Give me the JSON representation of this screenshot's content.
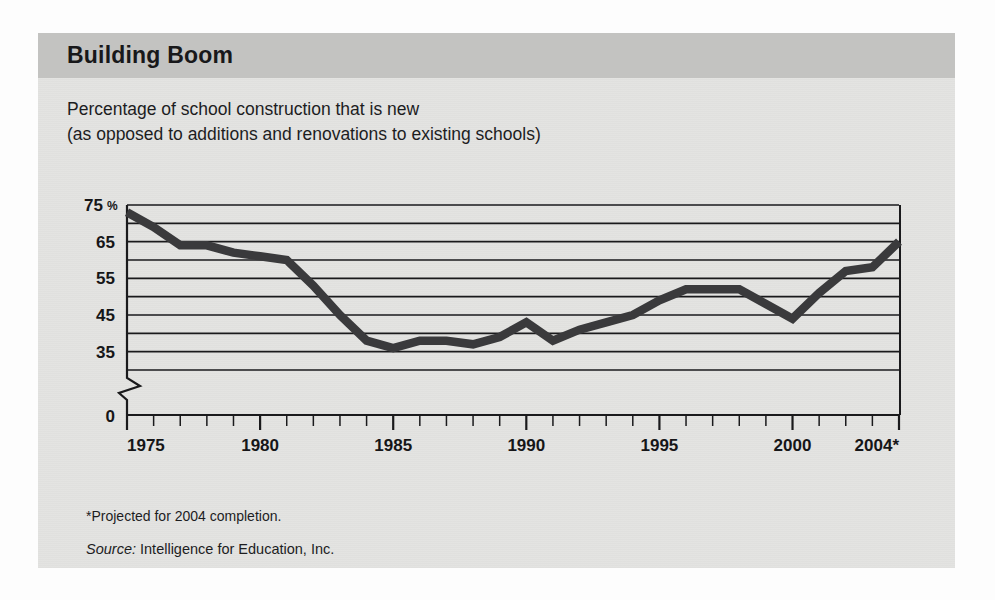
{
  "panel": {
    "header_title": "Building Boom",
    "subtitle_line1": "Percentage of school construction that is new",
    "subtitle_line2": "(as opposed to additions and renovations to existing schools)",
    "footnote": "*Projected for 2004 completion.",
    "source_label": "Source:",
    "source_text": " Intelligence for Education, Inc.",
    "colors": {
      "panel_background": "#e3e3e1",
      "header_background": "#c3c3c1",
      "line": "#3a3a3c",
      "grid": "#1a1a1c",
      "text": "#18181a"
    }
  },
  "chart_data": {
    "type": "line",
    "title": "Building Boom",
    "subtitle": "Percentage of school construction that is new (as opposed to additions and renovations to existing schools)",
    "xlabel": "",
    "ylabel": "",
    "ylim": [
      30,
      75
    ],
    "axis_break": true,
    "zero_label": "0",
    "grid": true,
    "grid_values": [
      75,
      70,
      65,
      60,
      55,
      50,
      45,
      40,
      35,
      30
    ],
    "legend": "none",
    "y_tick_labels": [
      "75 %",
      "65",
      "55",
      "45",
      "35",
      "0"
    ],
    "y_tick_values": [
      75,
      65,
      55,
      45,
      35,
      30
    ],
    "y_pct_suffix": "%",
    "x_tick_labels": [
      "1975",
      "1980",
      "1985",
      "1990",
      "1995",
      "2000",
      "2004*"
    ],
    "x_tick_values": [
      1975,
      1980,
      1985,
      1990,
      1995,
      2000,
      2004
    ],
    "x_minor_ticks": [
      1975,
      1976,
      1977,
      1978,
      1979,
      1980,
      1981,
      1982,
      1983,
      1984,
      1985,
      1986,
      1987,
      1988,
      1989,
      1990,
      1991,
      1992,
      1993,
      1994,
      1995,
      1996,
      1997,
      1998,
      1999,
      2000,
      2001,
      2002,
      2003,
      2004
    ],
    "xlim": [
      1975,
      2004
    ],
    "x": [
      1975,
      1976,
      1977,
      1978,
      1979,
      1980,
      1981,
      1982,
      1983,
      1984,
      1985,
      1986,
      1987,
      1988,
      1989,
      1990,
      1991,
      1992,
      1993,
      1994,
      1995,
      1996,
      1997,
      1998,
      1999,
      2000,
      2001,
      2002,
      2003,
      2004
    ],
    "values": [
      73,
      69,
      64,
      64,
      62,
      61,
      60,
      53,
      45,
      38,
      36,
      38,
      38,
      37,
      39,
      43,
      38,
      41,
      43,
      45,
      49,
      52,
      52,
      52,
      48,
      44,
      51,
      57,
      58,
      65
    ],
    "annotations": [
      {
        "text": "*Projected for 2004 completion.",
        "kind": "footnote"
      },
      {
        "text": "Source: Intelligence for Education, Inc.",
        "kind": "source"
      }
    ]
  }
}
